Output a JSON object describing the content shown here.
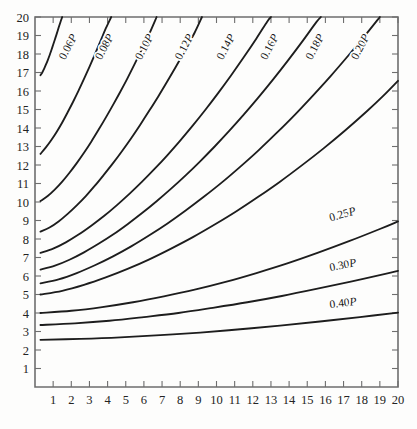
{
  "chart_data": {
    "type": "line",
    "title": "",
    "subtitle": "",
    "xlabel": "",
    "ylabel": "",
    "xlim": [
      0,
      20
    ],
    "ylim": [
      0,
      20
    ],
    "grid": false,
    "legend_position": "inline-curve-labels",
    "x_ticks": [
      1,
      2,
      3,
      4,
      5,
      6,
      7,
      8,
      9,
      10,
      11,
      12,
      13,
      14,
      15,
      16,
      17,
      18,
      19,
      20
    ],
    "y_ticks": [
      1,
      2,
      3,
      4,
      5,
      6,
      7,
      8,
      9,
      10,
      11,
      12,
      13,
      14,
      15,
      16,
      17,
      18,
      19,
      20
    ],
    "x_tick_labels": [
      "1",
      "2",
      "3",
      "4",
      "5",
      "6",
      "7",
      "8",
      "9",
      "10",
      "11",
      "12",
      "13",
      "14",
      "15",
      "16",
      "17",
      "18",
      "19",
      "20"
    ],
    "y_tick_labels": [
      "1",
      "2",
      "3",
      "4",
      "5",
      "6",
      "7",
      "8",
      "9",
      "10",
      "11",
      "12",
      "13",
      "14",
      "15",
      "16",
      "17",
      "18",
      "19",
      "20"
    ],
    "curve_color": "#1d1d1d",
    "frame_color": "#6e6e6e",
    "background_color": "#fdfdfc",
    "series": [
      {
        "name": "0.06P",
        "label": "0.06P",
        "label_numeric": "0.06",
        "label_suffix": "P",
        "label_position": {
          "x": 2.0,
          "y": 18.3,
          "rotation": -62
        },
        "points": [
          [
            0.3,
            16.85
          ],
          [
            0.4,
            17.0
          ],
          [
            0.5,
            17.2
          ],
          [
            0.6,
            17.42
          ],
          [
            0.7,
            17.66
          ],
          [
            0.8,
            17.92
          ],
          [
            0.9,
            18.2
          ],
          [
            1.0,
            18.5
          ],
          [
            1.1,
            18.8
          ],
          [
            1.2,
            19.1
          ],
          [
            1.3,
            19.42
          ],
          [
            1.4,
            19.72
          ],
          [
            1.5,
            20.0
          ]
        ]
      },
      {
        "name": "0.08P",
        "label": "0.08P",
        "label_numeric": "0.08",
        "label_suffix": "P",
        "label_position": {
          "x": 4.0,
          "y": 18.3,
          "rotation": -62
        },
        "points": [
          [
            0.3,
            12.6
          ],
          [
            0.6,
            12.95
          ],
          [
            0.9,
            13.35
          ],
          [
            1.2,
            13.8
          ],
          [
            1.5,
            14.3
          ],
          [
            1.8,
            14.85
          ],
          [
            2.1,
            15.42
          ],
          [
            2.4,
            16.02
          ],
          [
            2.7,
            16.65
          ],
          [
            3.0,
            17.3
          ],
          [
            3.3,
            17.98
          ],
          [
            3.6,
            18.68
          ],
          [
            3.9,
            19.38
          ],
          [
            4.2,
            20.0
          ]
        ]
      },
      {
        "name": "0.10P",
        "label": "0.10P",
        "label_numeric": "0.10",
        "label_suffix": "P",
        "label_position": {
          "x": 6.2,
          "y": 18.3,
          "rotation": -62
        },
        "points": [
          [
            0.3,
            10.05
          ],
          [
            0.7,
            10.32
          ],
          [
            1.1,
            10.68
          ],
          [
            1.5,
            11.1
          ],
          [
            1.9,
            11.58
          ],
          [
            2.3,
            12.1
          ],
          [
            2.7,
            12.66
          ],
          [
            3.1,
            13.26
          ],
          [
            3.5,
            13.9
          ],
          [
            3.9,
            14.56
          ],
          [
            4.3,
            15.25
          ],
          [
            4.7,
            15.96
          ],
          [
            5.1,
            16.7
          ],
          [
            5.5,
            17.48
          ],
          [
            5.9,
            18.28
          ],
          [
            6.3,
            19.1
          ],
          [
            6.7,
            20.0
          ]
        ]
      },
      {
        "name": "0.12P",
        "label": "0.12P",
        "label_numeric": "0.12",
        "label_suffix": "P",
        "label_position": {
          "x": 8.4,
          "y": 18.3,
          "rotation": -62
        },
        "points": [
          [
            0.3,
            8.4
          ],
          [
            0.8,
            8.62
          ],
          [
            1.3,
            8.95
          ],
          [
            1.8,
            9.36
          ],
          [
            2.3,
            9.82
          ],
          [
            2.8,
            10.32
          ],
          [
            3.3,
            10.88
          ],
          [
            3.8,
            11.48
          ],
          [
            4.3,
            12.1
          ],
          [
            4.8,
            12.76
          ],
          [
            5.3,
            13.45
          ],
          [
            5.8,
            14.18
          ],
          [
            6.3,
            14.94
          ],
          [
            6.8,
            15.72
          ],
          [
            7.3,
            16.54
          ],
          [
            7.8,
            17.38
          ],
          [
            8.3,
            18.26
          ],
          [
            8.8,
            19.16
          ],
          [
            9.2,
            20.0
          ]
        ]
      },
      {
        "name": "0.14P",
        "label": "0.14P",
        "label_numeric": "0.14",
        "label_suffix": "P",
        "label_position": {
          "x": 10.7,
          "y": 18.3,
          "rotation": -62
        },
        "points": [
          [
            0.3,
            7.25
          ],
          [
            1.0,
            7.48
          ],
          [
            1.7,
            7.82
          ],
          [
            2.4,
            8.24
          ],
          [
            3.1,
            8.72
          ],
          [
            3.8,
            9.24
          ],
          [
            4.5,
            9.82
          ],
          [
            5.2,
            10.44
          ],
          [
            5.9,
            11.1
          ],
          [
            6.6,
            11.8
          ],
          [
            7.3,
            12.54
          ],
          [
            8.0,
            13.32
          ],
          [
            8.7,
            14.14
          ],
          [
            9.4,
            15.0
          ],
          [
            10.1,
            15.9
          ],
          [
            10.8,
            16.84
          ],
          [
            11.5,
            17.82
          ],
          [
            12.2,
            18.84
          ],
          [
            12.8,
            19.76
          ],
          [
            13.0,
            20.0
          ]
        ]
      },
      {
        "name": "0.16P",
        "label": "0.16P",
        "label_numeric": "0.16",
        "label_suffix": "P",
        "label_position": {
          "x": 13.1,
          "y": 18.3,
          "rotation": -62
        },
        "points": [
          [
            0.3,
            6.35
          ],
          [
            1.1,
            6.56
          ],
          [
            1.9,
            6.88
          ],
          [
            2.7,
            7.28
          ],
          [
            3.5,
            7.74
          ],
          [
            4.3,
            8.24
          ],
          [
            5.1,
            8.8
          ],
          [
            5.9,
            9.4
          ],
          [
            6.7,
            10.04
          ],
          [
            7.5,
            10.72
          ],
          [
            8.3,
            11.44
          ],
          [
            9.1,
            12.2
          ],
          [
            9.9,
            13.0
          ],
          [
            10.7,
            13.84
          ],
          [
            11.5,
            14.72
          ],
          [
            12.3,
            15.64
          ],
          [
            13.1,
            16.6
          ],
          [
            13.9,
            17.6
          ],
          [
            14.7,
            18.64
          ],
          [
            15.5,
            19.72
          ],
          [
            15.75,
            20.0
          ]
        ]
      },
      {
        "name": "0.18P",
        "label": "0.18P",
        "label_numeric": "0.18",
        "label_suffix": "P",
        "label_position": {
          "x": 15.6,
          "y": 18.3,
          "rotation": -62
        },
        "points": [
          [
            0.3,
            5.6
          ],
          [
            1.3,
            5.82
          ],
          [
            2.3,
            6.16
          ],
          [
            3.3,
            6.58
          ],
          [
            4.3,
            7.06
          ],
          [
            5.3,
            7.6
          ],
          [
            6.3,
            8.2
          ],
          [
            7.3,
            8.84
          ],
          [
            8.3,
            9.54
          ],
          [
            9.3,
            10.28
          ],
          [
            10.3,
            11.06
          ],
          [
            11.3,
            11.9
          ],
          [
            12.3,
            12.78
          ],
          [
            13.3,
            13.72
          ],
          [
            14.3,
            14.7
          ],
          [
            15.3,
            15.74
          ],
          [
            16.3,
            16.82
          ],
          [
            17.3,
            17.96
          ],
          [
            18.3,
            19.14
          ],
          [
            19.0,
            20.0
          ]
        ]
      },
      {
        "name": "0.20P",
        "label": "0.20P",
        "label_numeric": "0.20",
        "label_suffix": "P",
        "label_position": {
          "x": 18.1,
          "y": 18.3,
          "rotation": -62
        },
        "points": [
          [
            0.3,
            5.0
          ],
          [
            1.5,
            5.2
          ],
          [
            2.7,
            5.52
          ],
          [
            3.9,
            5.92
          ],
          [
            5.1,
            6.38
          ],
          [
            6.3,
            6.9
          ],
          [
            7.5,
            7.48
          ],
          [
            8.7,
            8.1
          ],
          [
            9.9,
            8.78
          ],
          [
            11.1,
            9.5
          ],
          [
            12.3,
            10.28
          ],
          [
            13.5,
            11.1
          ],
          [
            14.7,
            11.98
          ],
          [
            15.9,
            12.9
          ],
          [
            17.1,
            13.88
          ],
          [
            18.3,
            14.92
          ],
          [
            19.2,
            15.75
          ],
          [
            20.0,
            16.55
          ]
        ]
      },
      {
        "name": "0.25P",
        "label": "0.25P",
        "label_numeric": "0.25",
        "label_suffix": "P",
        "label_position": {
          "x": 17.0,
          "y": 9.15,
          "rotation": -16
        },
        "points": [
          [
            0.3,
            4.0
          ],
          [
            2.0,
            4.12
          ],
          [
            3.7,
            4.32
          ],
          [
            5.4,
            4.58
          ],
          [
            7.1,
            4.9
          ],
          [
            8.8,
            5.26
          ],
          [
            10.5,
            5.68
          ],
          [
            12.2,
            6.16
          ],
          [
            13.9,
            6.68
          ],
          [
            15.6,
            7.26
          ],
          [
            17.3,
            7.88
          ],
          [
            19.0,
            8.54
          ],
          [
            20.0,
            8.95
          ]
        ]
      },
      {
        "name": "0.30P",
        "label": "0.30P",
        "label_numeric": "0.30",
        "label_suffix": "P",
        "label_position": {
          "x": 17.0,
          "y": 6.4,
          "rotation": -11
        },
        "points": [
          [
            0.3,
            3.35
          ],
          [
            2.2,
            3.44
          ],
          [
            4.1,
            3.58
          ],
          [
            6.0,
            3.78
          ],
          [
            7.9,
            4.0
          ],
          [
            9.8,
            4.28
          ],
          [
            11.7,
            4.58
          ],
          [
            13.6,
            4.92
          ],
          [
            15.5,
            5.3
          ],
          [
            17.4,
            5.7
          ],
          [
            19.3,
            6.12
          ],
          [
            20.0,
            6.28
          ]
        ]
      },
      {
        "name": "0.40P",
        "label": "0.40P",
        "label_numeric": "0.40",
        "label_suffix": "P",
        "label_position": {
          "x": 17.0,
          "y": 4.35,
          "rotation": -7
        },
        "points": [
          [
            0.3,
            2.55
          ],
          [
            2.5,
            2.6
          ],
          [
            4.7,
            2.68
          ],
          [
            6.9,
            2.8
          ],
          [
            9.1,
            2.94
          ],
          [
            11.3,
            3.12
          ],
          [
            13.5,
            3.32
          ],
          [
            15.7,
            3.54
          ],
          [
            17.9,
            3.78
          ],
          [
            20.0,
            4.02
          ]
        ]
      }
    ]
  },
  "plot": {
    "frame": {
      "left_px": 35,
      "right_px": 398,
      "top_px": 17,
      "bottom_px": 387
    }
  }
}
